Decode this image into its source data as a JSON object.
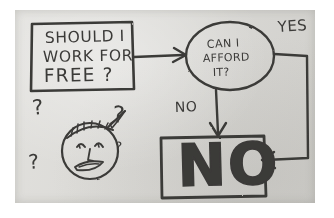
{
  "diagram": {
    "medium": "photo of pencil sketch on gray paper",
    "ink_color": "#3b3a38",
    "paper_color": "#dcdbd7",
    "background_color": "#ffffff"
  },
  "nodes": {
    "start_box": {
      "shape": "rectangle",
      "lines": [
        "SHOULD I",
        "WORK FOR",
        "FREE ?"
      ]
    },
    "decision_oval": {
      "shape": "ellipse",
      "lines": [
        "CAN I",
        "AFFORD",
        "IT?"
      ]
    },
    "answer_box": {
      "shape": "rectangle",
      "text": "NO"
    }
  },
  "edge_labels": {
    "yes": "YES",
    "no": "NO"
  },
  "doodle": {
    "name": "confused-face",
    "question_marks": [
      "?",
      "?",
      "?",
      "?"
    ]
  }
}
